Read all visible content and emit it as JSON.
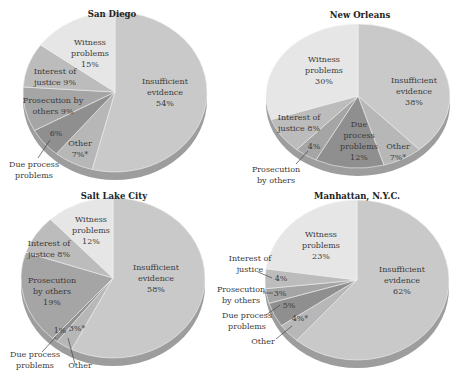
{
  "chart_data": [
    {
      "type": "pie",
      "title": "San Diego",
      "categories": [
        "Insufficient evidence",
        "Other",
        "Due process problems",
        "Prosecution by others",
        "Interest of justice",
        "Witness problems"
      ],
      "values": [
        54,
        7,
        6,
        9,
        9,
        15
      ],
      "labels": [
        "Insufficient evidence 54%",
        "Other 7%*",
        "6%",
        "Prosecution by others 9%",
        "Interest of justice 9%",
        "Witness problems 15%"
      ],
      "callouts": [
        "Due process problems"
      ]
    },
    {
      "type": "pie",
      "title": "New Orleans",
      "categories": [
        "Insufficient evidence",
        "Other",
        "Due process problems",
        "Prosecution by others",
        "Interest of justice",
        "Witness problems"
      ],
      "values": [
        38,
        7,
        12,
        4,
        8,
        30
      ],
      "labels": [
        "Insufficient evidence 38%",
        "Other 7%*",
        "Due process problems 12%",
        "4%",
        "Interest of justice 8%",
        "Witness problems 30%"
      ],
      "callouts": [
        "Prosecution by others"
      ]
    },
    {
      "type": "pie",
      "title": "Salt Lake City",
      "categories": [
        "Insufficient evidence",
        "Other",
        "Due process problems",
        "Prosecution by others",
        "Interest of justice",
        "Witness problems"
      ],
      "values": [
        58,
        3,
        1,
        19,
        8,
        12
      ],
      "labels": [
        "Insufficient evidence 58%",
        "3%*",
        "1%",
        "Prosecution by others 19%",
        "Interest of justice 8%",
        "Witness problems 12%"
      ],
      "callouts": [
        "Due process problems",
        "Other"
      ]
    },
    {
      "type": "pie",
      "title": "Manhattan, N.Y.C.",
      "categories": [
        "Insufficient evidence",
        "Other",
        "Due process problems",
        "Prosecution by others",
        "Interest of justice",
        "Witness problems"
      ],
      "values": [
        62,
        4,
        5,
        3,
        4,
        23
      ],
      "labels": [
        "Insufficient evidence 62%",
        "4%*",
        "5%",
        "3%",
        "4%",
        "Witness problems 23%"
      ],
      "callouts": [
        "Interest of justice",
        "Prosecution by others",
        "Due process problems",
        "Other"
      ]
    }
  ],
  "charts": {
    "sd": {
      "title": "San Diego",
      "ins": [
        "Insufficient",
        "evidence",
        "54%"
      ],
      "wit": [
        "Witness",
        "problems",
        "15%"
      ],
      "int": [
        "Interest of",
        "justice 9%"
      ],
      "pro": [
        "Prosecution by",
        "others 9%"
      ],
      "due_pct": "6%",
      "oth": [
        "Other",
        "7%*"
      ],
      "due_callout": [
        "Due process",
        "problems"
      ]
    },
    "no": {
      "title": "New Orleans",
      "ins": [
        "Insufficient",
        "evidence",
        "38%"
      ],
      "wit": [
        "Witness",
        "problems",
        "30%"
      ],
      "int": [
        "Interest of",
        "justice 8%"
      ],
      "pro_pct": "4%",
      "due": [
        "Due",
        "process",
        "problems",
        "12%"
      ],
      "oth": [
        "Other",
        "7%*"
      ],
      "pro_callout": [
        "Prosecution",
        "by others"
      ]
    },
    "slc": {
      "title": "Salt Lake City",
      "ins": [
        "Insufficient",
        "evidence",
        "58%"
      ],
      "wit": [
        "Witness",
        "problems",
        "12%"
      ],
      "int": [
        "Interest of",
        "justice 8%"
      ],
      "pro": [
        "Prosecution",
        "by others",
        "19%"
      ],
      "due_pct": "1%",
      "oth_pct": "3%*",
      "due_callout": [
        "Due process",
        "problems"
      ],
      "oth_callout": "Other"
    },
    "nyc": {
      "title": "Manhattan, N.Y.C.",
      "ins": [
        "Insufficient",
        "evidence",
        "62%"
      ],
      "wit": [
        "Witness",
        "problems",
        "23%"
      ],
      "int_pct": "4%",
      "pro_pct": "3%",
      "due_pct": "5%",
      "oth_pct": "4%*",
      "int_callout": [
        "Interest of",
        "justice"
      ],
      "pro_callout": [
        "Prosecution",
        "by others"
      ],
      "due_callout": [
        "Due process",
        "problems"
      ],
      "oth_callout": "Other"
    }
  },
  "colors": {
    "insufficient": "#c9c9c9",
    "other": "#b7b7b7",
    "due_process": "#8f8f8f",
    "prosecution": "#a5a5a5",
    "interest": "#bcbcbc",
    "witness": "#e6e6e6",
    "rim": "#9d9d9d"
  }
}
